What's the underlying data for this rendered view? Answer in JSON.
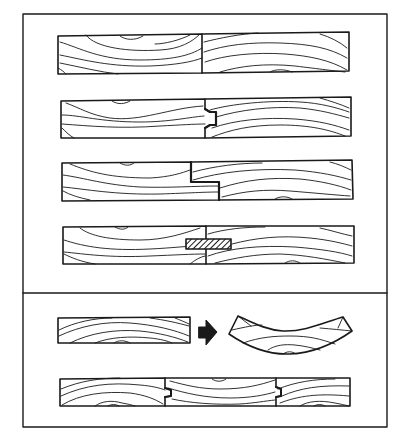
{
  "diagram": {
    "title": "",
    "colors": {
      "background": "#ffffff",
      "ink": "#1a1a1a",
      "spline_fill": "#555555"
    },
    "panels": [
      {
        "id": "joint-types",
        "items": [
          {
            "id": "butt-joint",
            "label": "butt joint"
          },
          {
            "id": "tongue-and-groove-joint",
            "label": "tongue and groove joint"
          },
          {
            "id": "shiplap-joint",
            "label": "rabbet / shiplap joint"
          },
          {
            "id": "spline-joint",
            "label": "spline joint"
          }
        ]
      },
      {
        "id": "cupping",
        "items": [
          {
            "id": "flat-board",
            "label": "flat board"
          },
          {
            "id": "arrow",
            "label": "becomes"
          },
          {
            "id": "cupped-board",
            "label": "cupped board"
          },
          {
            "id": "three-board-panel",
            "label": "panel of three tongue and groove boards"
          }
        ]
      }
    ]
  }
}
